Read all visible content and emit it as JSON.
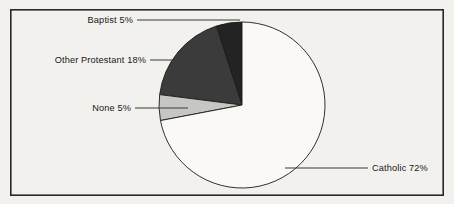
{
  "figure": {
    "background_color": "#f3f1ed",
    "frame_color": "#2a2825",
    "frame": {
      "x": 10,
      "y": 9,
      "width": 434,
      "height": 187
    }
  },
  "chart_data": {
    "type": "pie",
    "title": "",
    "subtitle": "",
    "xlabel": "",
    "ylabel": "",
    "legend_position": "none",
    "grid": false,
    "start_angle_deg": 90,
    "direction": "counterclockwise",
    "units": "percent",
    "center": {
      "x": 242,
      "y": 105
    },
    "radius": 83,
    "categories": [
      "Baptist",
      "Other Protestant",
      "None",
      "Catholic"
    ],
    "values": [
      5,
      18,
      5,
      72
    ],
    "labels": [
      "Baptist 5%",
      "Other Protestant 18%",
      "None 5%",
      "Catholic 72%"
    ],
    "colors": [
      "#232323",
      "#3c3b3b",
      "#c6c6c4",
      "#faf9f6"
    ],
    "slices": [
      {
        "name": "Baptist",
        "label": "Baptist 5%",
        "value": 5,
        "color": "#232323",
        "label_x": 133,
        "label_y": 23,
        "leader": "M137,20 L240,20"
      },
      {
        "name": "Other Protestant",
        "label": "Other Protestant 18%",
        "value": 18,
        "color": "#3c3b3b",
        "label_x": 146,
        "label_y": 63,
        "leader": "M150,60 L196,60"
      },
      {
        "name": "None",
        "label": "None 5%",
        "value": 5,
        "color": "#c6c6c4",
        "label_x": 131,
        "label_y": 111,
        "leader": "M135,108 L188,108"
      },
      {
        "name": "Catholic",
        "label": "Catholic 72%",
        "value": 72,
        "color": "#faf9f6",
        "label_x": 372,
        "label_y": 171,
        "leader": "M285,168 L368,168"
      }
    ]
  }
}
